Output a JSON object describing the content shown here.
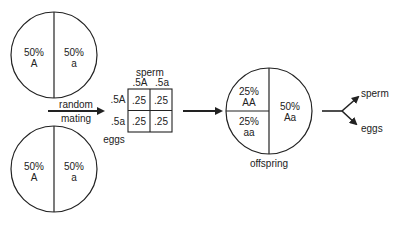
{
  "parents": {
    "top": {
      "left": {
        "pct": "50%",
        "allele": "A"
      },
      "right": {
        "pct": "50%",
        "allele": "a"
      }
    },
    "bottom": {
      "left": {
        "pct": "50%",
        "allele": "A"
      },
      "right": {
        "pct": "50%",
        "allele": "a"
      }
    }
  },
  "mating_label": {
    "line1": "random",
    "line2": "mating"
  },
  "punnett": {
    "col_title": "sperm",
    "row_title": "eggs",
    "col_headers": [
      ".5A",
      ".5a"
    ],
    "row_headers": [
      ".5A",
      ".5a"
    ],
    "cells": [
      [
        ".25",
        ".25"
      ],
      [
        ".25",
        ".25"
      ]
    ]
  },
  "offspring": {
    "label": "offspring",
    "top_left": {
      "pct": "25%",
      "genotype": "AA"
    },
    "bottom_left": {
      "pct": "25%",
      "genotype": "aa"
    },
    "right": {
      "pct": "50%",
      "genotype": "Aa"
    }
  },
  "outputs": {
    "up": "sperm",
    "down": "eggs"
  },
  "colors": {
    "line": "#222222",
    "background": "#ffffff"
  }
}
